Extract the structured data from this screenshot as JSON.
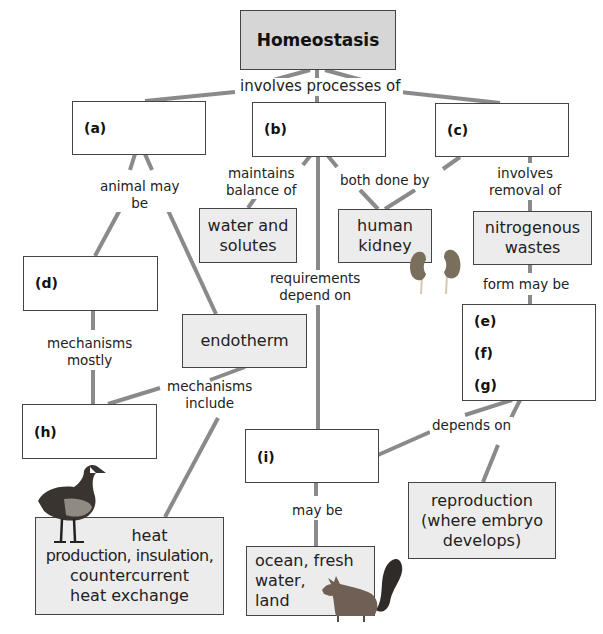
{
  "diagram": {
    "title": "Homeostasis",
    "nodes": {
      "a": {
        "label": "(a)"
      },
      "b": {
        "label": "(b)"
      },
      "c": {
        "label": "(c)"
      },
      "d": {
        "label": "(d)"
      },
      "e": {
        "label": "(e)"
      },
      "f": {
        "label": "(f)"
      },
      "g": {
        "label": "(g)"
      },
      "h": {
        "label": "(h)"
      },
      "i": {
        "label": "(i)"
      },
      "water": {
        "line1": "water and",
        "line2": "solutes"
      },
      "kidney": {
        "line1": "human",
        "line2": "kidney"
      },
      "nitro": {
        "line1": "nitrogenous",
        "line2": "wastes"
      },
      "endotherm": {
        "text": "endotherm"
      },
      "heat": {
        "line1": "heat",
        "line2": "production, insulation,",
        "line3": "countercurrent",
        "line4": "heat exchange"
      },
      "ocean": {
        "line1": "ocean, fresh",
        "line2": "water,",
        "line3": "land"
      },
      "repro": {
        "line1": "reproduction",
        "line2": "(where embryo",
        "line3": "develops)"
      }
    },
    "links": {
      "involves": "involves processes of",
      "animal_1": "animal may",
      "animal_2": "be",
      "maintains_1": "maintains",
      "maintains_2": "balance of",
      "both": "both done by",
      "removal_1": "involves",
      "removal_2": "removal of",
      "requirements_1": "requirements",
      "requirements_2": "depend on",
      "form": "form may be",
      "mostly_1": "mechanisms",
      "mostly_2": "mostly",
      "include_1": "mechanisms",
      "include_2": "include",
      "depends": "depends on",
      "maybe": "may be"
    },
    "images": [
      "kidney-icon",
      "goose-icon",
      "squirrel-icon"
    ],
    "colors": {
      "line": "#8a8a8a",
      "box_border": "#444444",
      "shaded_fill": "#ececec",
      "title_fill": "#d6d6d6"
    }
  }
}
